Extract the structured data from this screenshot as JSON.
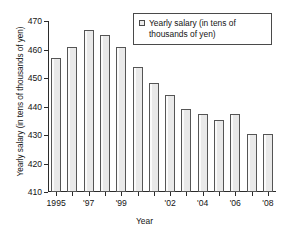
{
  "chart_data": {
    "type": "bar",
    "title": "",
    "xlabel": "Year",
    "ylabel": "Yearly salary (in tens of thousands of yen)",
    "ylim": [
      410,
      470
    ],
    "ytick_labels": [
      "410",
      "420",
      "430",
      "440",
      "450",
      "460",
      "470"
    ],
    "ytick_values": [
      410,
      420,
      430,
      440,
      450,
      460,
      470
    ],
    "grid": false,
    "legend_position": "top-right",
    "legend": [
      "Yearly salary (in tens of thousands of yen)"
    ],
    "categories": [
      "1995",
      "1996",
      "1997",
      "1998",
      "1999",
      "2000",
      "2001",
      "2002",
      "2003",
      "2004",
      "2005",
      "2006",
      "2007",
      "2008"
    ],
    "xtick_labels": [
      "1995",
      "",
      "'97",
      "",
      "'99",
      "",
      "'02",
      "",
      "'04",
      "",
      "'06",
      "",
      "'08",
      ""
    ],
    "visible_xtick_labels": [
      {
        "category": "1995",
        "label": "1995"
      },
      {
        "category": "1997",
        "label": "'97"
      },
      {
        "category": "1999",
        "label": "'99"
      },
      {
        "category": "2002",
        "label": "'02"
      },
      {
        "category": "2004",
        "label": "'04"
      },
      {
        "category": "2006",
        "label": "'06"
      },
      {
        "category": "2008",
        "label": "'08"
      }
    ],
    "values": [
      457,
      461,
      467,
      465,
      461,
      454,
      448.3,
      444.2,
      439.2,
      437.2,
      435.2,
      437.2,
      430.2,
      430.2
    ],
    "series": [
      {
        "name": "Yearly salary (in tens of thousands of yen)",
        "values": [
          457,
          461,
          467,
          465,
          461,
          454,
          448.3,
          444.2,
          439.2,
          437.2,
          435.2,
          437.2,
          430.2,
          430.2
        ]
      }
    ],
    "bar_color": "#e9e9e9",
    "bar_edge_color": "#555555"
  },
  "axes": {
    "y_title": "Yearly salary (in tens of thousands of yen)",
    "x_title": "Year"
  },
  "legend": {
    "label": "Yearly salary (in tens of thousands of yen)",
    "marker": "square-swatch"
  }
}
